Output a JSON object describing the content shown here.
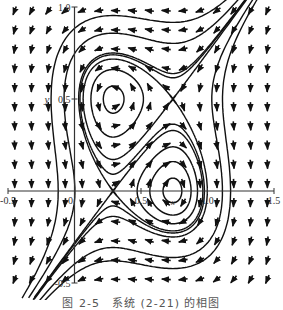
{
  "chart_data": {
    "type": "phase-portrait",
    "title": "",
    "caption": "图 2-5　系统 (2-21) 的相图",
    "xlabel": "x",
    "ylabel": "y",
    "xlim": [
      -0.5,
      1.5
    ],
    "ylim": [
      -0.5,
      1.0
    ],
    "x_ticks": [
      {
        "value": -0.5,
        "label": "-0.5"
      },
      {
        "value": 0,
        "label": "0"
      },
      {
        "value": 0.5,
        "label": "0.5"
      },
      {
        "value": 1.0,
        "label": "1.0"
      },
      {
        "value": 1.5,
        "label": "1.5"
      }
    ],
    "y_ticks": [
      {
        "value": 1.0,
        "label": "1.0"
      },
      {
        "value": 0.5,
        "label": "0.5"
      },
      {
        "value": -0.5,
        "label": "-0.5"
      }
    ],
    "equilibria": [
      {
        "type": "center",
        "x": 0.29,
        "y": 0.5
      },
      {
        "type": "center",
        "x": 0.74,
        "y": 0.0
      },
      {
        "type": "saddle",
        "x": 0.74,
        "y": 0.5
      },
      {
        "type": "saddle",
        "x": 0.29,
        "y": 0.0
      }
    ],
    "field": {
      "description": "direction field arrows on a grid",
      "x_range": [
        -0.45,
        1.45
      ],
      "y_range": [
        -0.48,
        0.98
      ],
      "cols": 16,
      "rows": 15
    },
    "grid": false,
    "legend": "none"
  },
  "axes_labels": {
    "x_extra": "x",
    "y": "y"
  }
}
